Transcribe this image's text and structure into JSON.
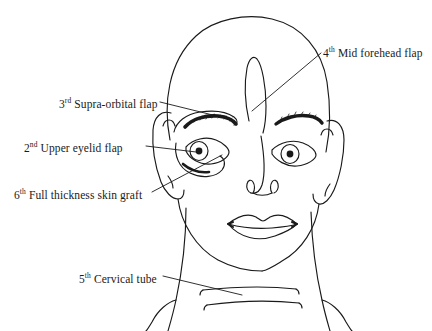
{
  "figure": {
    "background_color": "#ffffff",
    "stroke_color": "#1a1a1a",
    "text_color": "#1a1a1a"
  },
  "labels": {
    "mid_forehead": {
      "ordinal": "4",
      "suffix": "th",
      "text": " Mid forehead flap"
    },
    "supra_orbital": {
      "ordinal": "3",
      "suffix": "rd",
      "text": " Supra-orbital flap"
    },
    "upper_eyelid": {
      "ordinal": "2",
      "suffix": "nd",
      "text": " Upper eyelid flap"
    },
    "skin_graft": {
      "ordinal": "6",
      "suffix": "th",
      "text": " Full thickness skin graft"
    },
    "cervical_tube": {
      "ordinal": "5",
      "suffix": "th",
      "text": " Cervical tube"
    }
  }
}
